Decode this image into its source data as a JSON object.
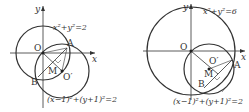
{
  "figures": [
    {
      "circle_label": "x²+y²=2",
      "small_circle_label": "(x−1)²+(y+1)²=2",
      "axis_x": "x",
      "axis_y": "y",
      "points": {
        "O": "O",
        "A": "A",
        "B": "B",
        "M": "M",
        "Oprime": "O′"
      }
    },
    {
      "circle_label": "x²+y²=6",
      "small_circle_label": "(x−1)²+(y+1)²=2",
      "axis_x": "x",
      "axis_y": "y",
      "points": {
        "O": "O",
        "A": "A",
        "B": "B",
        "M": "M",
        "Oprime": "O′"
      }
    }
  ]
}
